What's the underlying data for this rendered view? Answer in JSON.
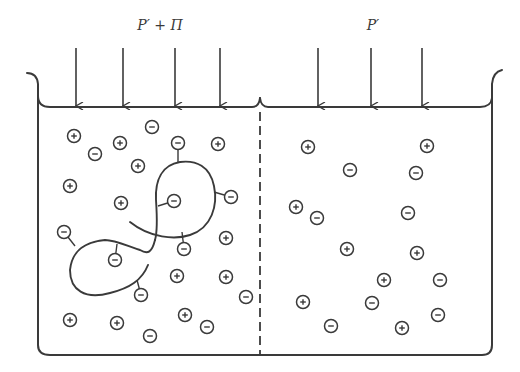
{
  "diagram": {
    "title": "",
    "labels": {
      "left_pressure": "P′ + Π",
      "right_pressure": "P′"
    },
    "colors": {
      "ink": "#3a3a3a",
      "background": "#ffffff"
    },
    "container": {
      "outer_left_x": 37,
      "outer_right_x": 492,
      "piston_y": 107,
      "bottom_y": 355,
      "membrane_x": 260,
      "membrane_style": "dashed"
    },
    "arrows": {
      "left": [
        76,
        123,
        175,
        220
      ],
      "right": [
        318,
        371,
        422
      ],
      "top_y": 48,
      "bottom_y": 106
    },
    "compartments": [
      {
        "name": "left",
        "pressure_label": "P′ + Π",
        "contains_polyelectrolyte": true,
        "free_ions": [
          {
            "charge": "+",
            "x": 74,
            "y": 136
          },
          {
            "charge": "−",
            "x": 95,
            "y": 154
          },
          {
            "charge": "+",
            "x": 120,
            "y": 143
          },
          {
            "charge": "−",
            "x": 152,
            "y": 127
          },
          {
            "charge": "+",
            "x": 138,
            "y": 166
          },
          {
            "charge": "+",
            "x": 70,
            "y": 186
          },
          {
            "charge": "+",
            "x": 121,
            "y": 203
          },
          {
            "charge": "+",
            "x": 218,
            "y": 144
          },
          {
            "charge": "+",
            "x": 226,
            "y": 238
          },
          {
            "charge": "+",
            "x": 177,
            "y": 276
          },
          {
            "charge": "+",
            "x": 226,
            "y": 277
          },
          {
            "charge": "−",
            "x": 246,
            "y": 297
          },
          {
            "charge": "+",
            "x": 70,
            "y": 320
          },
          {
            "charge": "+",
            "x": 117,
            "y": 323
          },
          {
            "charge": "−",
            "x": 150,
            "y": 336
          },
          {
            "charge": "+",
            "x": 185,
            "y": 315
          },
          {
            "charge": "−",
            "x": 207,
            "y": 327
          }
        ],
        "bound_ions": [
          {
            "charge": "−",
            "x": 178,
            "y": 143,
            "anchor_x": 178,
            "anchor_y": 162
          },
          {
            "charge": "−",
            "x": 174,
            "y": 201,
            "anchor_x": 158,
            "anchor_y": 206
          },
          {
            "charge": "−",
            "x": 231,
            "y": 197,
            "anchor_x": 214,
            "anchor_y": 192
          },
          {
            "charge": "−",
            "x": 184,
            "y": 249,
            "anchor_x": 182,
            "anchor_y": 232
          },
          {
            "charge": "−",
            "x": 64,
            "y": 232,
            "anchor_x": 75,
            "anchor_y": 246
          },
          {
            "charge": "−",
            "x": 115,
            "y": 260,
            "anchor_x": 117,
            "anchor_y": 244
          },
          {
            "charge": "−",
            "x": 141,
            "y": 295,
            "anchor_x": 137,
            "anchor_y": 280
          }
        ]
      },
      {
        "name": "right",
        "pressure_label": "P′",
        "contains_polyelectrolyte": false,
        "free_ions": [
          {
            "charge": "+",
            "x": 308,
            "y": 147
          },
          {
            "charge": "+",
            "x": 427,
            "y": 146
          },
          {
            "charge": "−",
            "x": 350,
            "y": 170
          },
          {
            "charge": "−",
            "x": 416,
            "y": 173
          },
          {
            "charge": "+",
            "x": 296,
            "y": 207
          },
          {
            "charge": "−",
            "x": 317,
            "y": 218
          },
          {
            "charge": "−",
            "x": 408,
            "y": 213
          },
          {
            "charge": "+",
            "x": 347,
            "y": 249
          },
          {
            "charge": "+",
            "x": 417,
            "y": 253
          },
          {
            "charge": "+",
            "x": 384,
            "y": 280
          },
          {
            "charge": "−",
            "x": 440,
            "y": 280
          },
          {
            "charge": "+",
            "x": 303,
            "y": 302
          },
          {
            "charge": "−",
            "x": 372,
            "y": 303
          },
          {
            "charge": "−",
            "x": 438,
            "y": 315
          },
          {
            "charge": "−",
            "x": 331,
            "y": 326
          },
          {
            "charge": "+",
            "x": 402,
            "y": 328
          }
        ]
      }
    ]
  }
}
